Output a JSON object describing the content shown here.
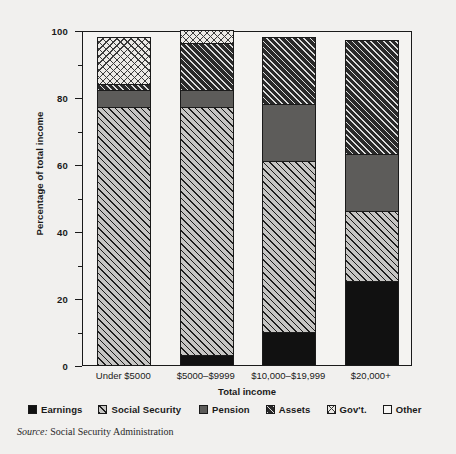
{
  "chart_data": {
    "type": "bar",
    "subtype": "stacked-bar-100-percent",
    "title": "",
    "xlabel": "Total income",
    "ylabel": "Percentage of total income",
    "ylim": [
      0,
      100
    ],
    "yticks": [
      0,
      20,
      40,
      60,
      80,
      100
    ],
    "ytick_labels": [
      "0",
      "20",
      "40",
      "60",
      "80",
      "100"
    ],
    "yminor_ticks": [
      10,
      30,
      50,
      70,
      90
    ],
    "grid": false,
    "legend_position": "bottom",
    "categories": [
      "Under $5000",
      "$5000–$9999",
      "$10,000–$19,999",
      "$20,000+"
    ],
    "series": [
      {
        "name": "Earnings",
        "key": "earnings",
        "values": [
          0,
          3,
          10,
          25
        ]
      },
      {
        "name": "Social Security",
        "key": "socsec",
        "values": [
          77,
          74,
          51,
          21
        ]
      },
      {
        "name": "Pension",
        "key": "pension",
        "values": [
          5,
          5,
          17,
          17
        ]
      },
      {
        "name": "Assets",
        "key": "assets",
        "values": [
          2,
          14,
          20,
          34
        ]
      },
      {
        "name": "Gov't.",
        "key": "govt",
        "values": [
          14,
          4,
          0,
          0
        ]
      },
      {
        "name": "Other",
        "key": "other",
        "values": [
          0,
          0,
          0,
          0
        ]
      }
    ],
    "annotations": [],
    "source": "Social Security Administration"
  },
  "axes": {
    "y_title": "Percentage of total income",
    "x_title": "Total income",
    "y_tick_labels": [
      "100",
      "80",
      "60",
      "40",
      "20",
      "0"
    ],
    "x_tick_labels": [
      "Under $5000",
      "$5000–$9999",
      "$10,000–$19,999",
      "$20,000+"
    ]
  },
  "legend": {
    "items": [
      {
        "label": "Earnings",
        "swatch": "earnings"
      },
      {
        "label": "Social Security",
        "swatch": "socsec"
      },
      {
        "label": "Pension",
        "swatch": "pension"
      },
      {
        "label": "Assets",
        "swatch": "assets"
      },
      {
        "label": "Gov't.",
        "swatch": "govt"
      },
      {
        "label": "Other",
        "swatch": "other"
      }
    ]
  },
  "source": {
    "prefix": "Source:",
    "text": "Social Security Administration"
  },
  "colors": {
    "background": "#f1f0ee",
    "plot_background": "#f4f3f1",
    "ink": "#1a1a1a",
    "earnings": "#111111",
    "socsec": "#c6c5c3",
    "pension": "#5d5c5a",
    "assets": "#2a2a2a",
    "govt": "#eceae6",
    "other": "#f7f6f4"
  }
}
